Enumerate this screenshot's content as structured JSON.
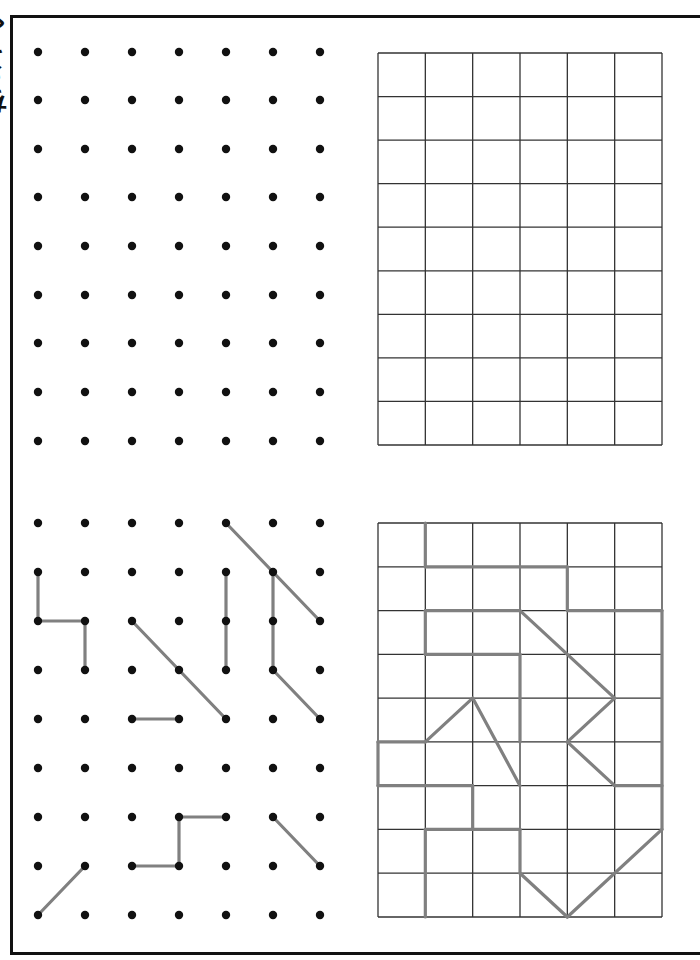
{
  "worksheet": {
    "side_title": "ちぇっく",
    "colors": {
      "border": "#111111",
      "dot": "#111111",
      "grid_line": "#333333",
      "drawn_line": "#808080"
    },
    "dot_grid_top": {
      "columns": 7,
      "rows": 9,
      "x": [
        38,
        85,
        132,
        179,
        226,
        273,
        320
      ],
      "y": [
        52,
        100,
        149,
        197,
        246,
        295,
        343,
        392,
        441
      ],
      "segments": []
    },
    "dot_grid_bottom": {
      "columns": 7,
      "rows": 9,
      "x": [
        38,
        85,
        132,
        179,
        226,
        273,
        320
      ],
      "y": [
        523,
        572,
        621,
        670,
        719,
        768,
        817,
        866,
        915
      ],
      "segments": [
        [
          [
            0,
            1
          ],
          [
            0,
            2
          ]
        ],
        [
          [
            0,
            2
          ],
          [
            1,
            2
          ]
        ],
        [
          [
            1,
            2
          ],
          [
            1,
            3
          ]
        ],
        [
          [
            4,
            0
          ],
          [
            6,
            2
          ]
        ],
        [
          [
            2,
            2
          ],
          [
            4,
            4
          ]
        ],
        [
          [
            4,
            1
          ],
          [
            4,
            3
          ]
        ],
        [
          [
            5,
            1
          ],
          [
            5,
            3
          ]
        ],
        [
          [
            5,
            3
          ],
          [
            6,
            4
          ]
        ],
        [
          [
            2,
            4
          ],
          [
            3,
            4
          ]
        ],
        [
          [
            3,
            6
          ],
          [
            4,
            6
          ]
        ],
        [
          [
            3,
            6
          ],
          [
            3,
            7
          ]
        ],
        [
          [
            2,
            7
          ],
          [
            3,
            7
          ]
        ],
        [
          [
            5,
            6
          ],
          [
            6,
            7
          ]
        ],
        [
          [
            0,
            8
          ],
          [
            1,
            7
          ]
        ]
      ]
    },
    "square_grid_top": {
      "columns": 6,
      "rows": 9,
      "left": 378,
      "right": 662,
      "top": 53,
      "bottom": 445,
      "segments": []
    },
    "square_grid_bottom": {
      "columns": 6,
      "rows": 9,
      "left": 378,
      "right": 662,
      "top": 523,
      "bottom": 917,
      "segments": [
        [
          [
            1,
            0
          ],
          [
            1,
            1
          ]
        ],
        [
          [
            1,
            1
          ],
          [
            4,
            1
          ]
        ],
        [
          [
            4,
            1
          ],
          [
            4,
            2
          ]
        ],
        [
          [
            4,
            2
          ],
          [
            6,
            2
          ]
        ],
        [
          [
            6,
            2
          ],
          [
            6,
            7
          ]
        ],
        [
          [
            1,
            2
          ],
          [
            3,
            2
          ]
        ],
        [
          [
            1,
            2
          ],
          [
            1,
            3
          ]
        ],
        [
          [
            1,
            3
          ],
          [
            3,
            3
          ]
        ],
        [
          [
            3,
            3
          ],
          [
            3,
            5
          ]
        ],
        [
          [
            3,
            2
          ],
          [
            5,
            4
          ]
        ],
        [
          [
            5,
            4
          ],
          [
            4,
            5
          ]
        ],
        [
          [
            4,
            5
          ],
          [
            5,
            6
          ]
        ],
        [
          [
            5,
            6
          ],
          [
            6,
            6
          ]
        ],
        [
          [
            1,
            5
          ],
          [
            2,
            4
          ]
        ],
        [
          [
            2,
            4
          ],
          [
            3,
            6
          ]
        ],
        [
          [
            0,
            5
          ],
          [
            1,
            5
          ]
        ],
        [
          [
            0,
            5
          ],
          [
            0,
            6
          ]
        ],
        [
          [
            0,
            6
          ],
          [
            2,
            6
          ]
        ],
        [
          [
            2,
            6
          ],
          [
            2,
            7
          ]
        ],
        [
          [
            1,
            7
          ],
          [
            3,
            7
          ]
        ],
        [
          [
            1,
            7
          ],
          [
            1,
            9
          ]
        ],
        [
          [
            3,
            7
          ],
          [
            3,
            8
          ]
        ],
        [
          [
            3,
            8
          ],
          [
            4,
            9
          ]
        ],
        [
          [
            4,
            9
          ],
          [
            6,
            7
          ]
        ]
      ]
    }
  }
}
